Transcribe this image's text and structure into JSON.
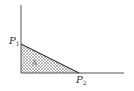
{
  "diagram": {
    "type": "budget-triangle",
    "points": {
      "p1": {
        "letter": "P",
        "sub": "1"
      },
      "p2": {
        "letter": "P",
        "sub": "2"
      }
    },
    "region_label": "A",
    "colors": {
      "axis": "#555555",
      "hatch": "#777777",
      "line": "#333333"
    }
  }
}
